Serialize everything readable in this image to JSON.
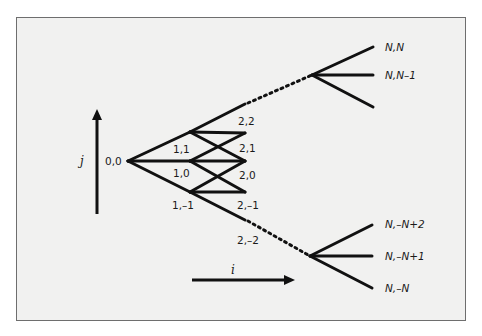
{
  "diagram": {
    "type": "trinomial-tree",
    "axes": {
      "vertical_label": "j",
      "horizontal_label": "i"
    },
    "nodes": [
      {
        "id": "0,0",
        "label": "0,0",
        "x": 128,
        "y": 161
      },
      {
        "id": "1,1",
        "label": "1,1",
        "x": 190,
        "y": 132
      },
      {
        "id": "1,0",
        "label": "1,0",
        "x": 190,
        "y": 161
      },
      {
        "id": "1,-1",
        "label": "1,–1",
        "x": 190,
        "y": 192
      },
      {
        "id": "2,2",
        "label": "2,2",
        "x": 245,
        "y": 104
      },
      {
        "id": "2,1",
        "label": "2,1",
        "x": 245,
        "y": 133
      },
      {
        "id": "2,0",
        "label": "2,0",
        "x": 245,
        "y": 161
      },
      {
        "id": "2,-1",
        "label": "2,–1",
        "x": 245,
        "y": 192
      },
      {
        "id": "2,-2",
        "label": "2,–2",
        "x": 245,
        "y": 220
      }
    ],
    "terminal_labels": {
      "top": [
        "N,N",
        "N,N–1"
      ],
      "bottom": [
        "N,–N+2",
        "N,–N+1",
        "N,–N"
      ]
    },
    "colors": {
      "line": "#111111",
      "frame_bg": "#f1f1f0",
      "frame_border": "#6e6e6e"
    }
  }
}
